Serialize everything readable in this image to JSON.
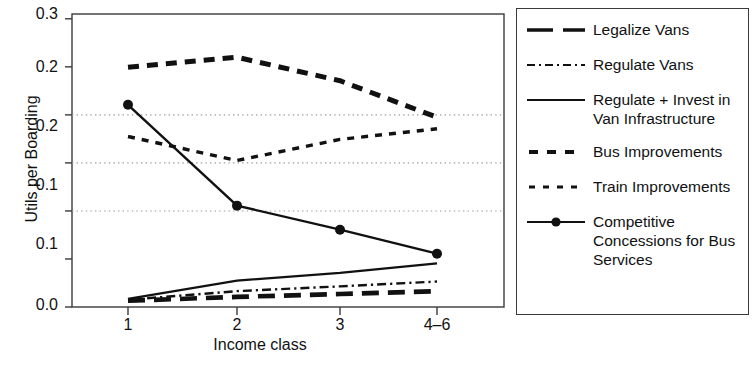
{
  "chart_data": {
    "type": "line",
    "title": "",
    "xlabel": "Income class",
    "ylabel": "Utils per Boarding",
    "categories": [
      "1",
      "2",
      "3",
      "4-6"
    ],
    "xtick_labels": [
      "1",
      "2",
      "3",
      "4–6"
    ],
    "ytick_labels": [
      "0.3",
      "0.2",
      "0.2",
      "0.1",
      "0.1",
      "0.0"
    ],
    "ytick_values": [
      0.3,
      0.25,
      0.2,
      0.15,
      0.1,
      0.05
    ],
    "ylim": [
      0.0,
      0.305
    ],
    "grid": "horizontal-dotted",
    "legend_position": "right",
    "series": [
      {
        "name": "Legalize Vans",
        "style": "long-dash",
        "values": [
          0.0065,
          0.0105,
          0.0135,
          0.0165
        ]
      },
      {
        "name": "Regulate Vans",
        "style": "dash-dot",
        "values": [
          0.0075,
          0.0165,
          0.0215,
          0.0265
        ]
      },
      {
        "name": "Regulate + Invest in Van Infrastructure",
        "style": "solid",
        "values": [
          0.0085,
          0.0275,
          0.0355,
          0.0455
        ]
      },
      {
        "name": "Bus Improvements",
        "style": "thick-dash",
        "values": [
          0.2495,
          0.26,
          0.2355,
          0.1975
        ]
      },
      {
        "name": "Train Improvements",
        "style": "short-dash",
        "values": [
          0.1775,
          0.1525,
          0.1745,
          0.1855
        ]
      },
      {
        "name": "Competitive Concessions for Bus Services",
        "style": "solid-marker",
        "marker": "filled-circle",
        "values": [
          0.2105,
          0.1055,
          0.0805,
          0.0555
        ]
      }
    ]
  },
  "axes": {
    "y_title": "Utils per Boarding",
    "x_title": "Income class",
    "y_ticks": [
      {
        "label": "0.3"
      },
      {
        "label": "0.2"
      },
      {
        "label": "0.2"
      },
      {
        "label": "0.1"
      },
      {
        "label": "0.1"
      },
      {
        "label": "0.0"
      }
    ],
    "x_ticks": [
      {
        "label": "1"
      },
      {
        "label": "2"
      },
      {
        "label": "3"
      },
      {
        "label": "4–6"
      }
    ]
  },
  "legend": {
    "items": [
      {
        "label": "Legalize Vans",
        "swatch": "long-dash-line-icon"
      },
      {
        "label": "Regulate Vans",
        "swatch": "dash-dot-line-icon"
      },
      {
        "label": "Regulate + Invest in\nVan Infrastructure",
        "swatch": "solid-line-icon"
      },
      {
        "label": "Bus Improvements",
        "swatch": "thick-dash-line-icon"
      },
      {
        "label": "Train Improvements",
        "swatch": "short-dash-line-icon"
      },
      {
        "label": "Competitive\nConcessions for Bus\nServices",
        "swatch": "solid-line-marker-icon"
      }
    ]
  },
  "colors": {
    "ink": "#111111",
    "axis": "#3a3a3a",
    "grid": "#9a9a9a",
    "background": "#ffffff"
  }
}
